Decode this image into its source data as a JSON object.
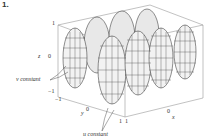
{
  "figure": {
    "number": "1.",
    "axes": {
      "z_label": "z",
      "y_label": "y",
      "x_label": "x",
      "z_ticks": [
        "1",
        "0",
        "−1"
      ],
      "y_ticks": [
        "−1",
        "0",
        "1"
      ],
      "x_ticks": [
        "1",
        "0"
      ]
    },
    "annotations": {
      "v_constant": "v constant",
      "u_constant": "u constant"
    },
    "colors": {
      "mesh": "#222222",
      "box": "#888888",
      "background": "#ffffff"
    }
  }
}
